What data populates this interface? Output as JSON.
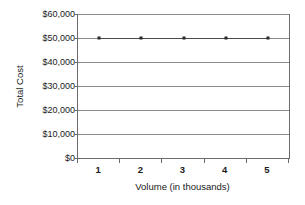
{
  "chart_data": {
    "type": "line",
    "title": "",
    "subtitle": "",
    "xlabel": "Volume (in thousands)",
    "ylabel": "Total Cost",
    "categories": [
      "1",
      "2",
      "3",
      "4",
      "5"
    ],
    "series": [
      {
        "name": "Total Cost",
        "values": [
          50000,
          50000,
          50000,
          50000,
          50000
        ],
        "line_color": "#4a4a4a",
        "marker": "square",
        "marker_color": "#262626"
      }
    ],
    "ylim": [
      0,
      60000
    ],
    "ytick_values": [
      0,
      10000,
      20000,
      30000,
      40000,
      50000,
      60000
    ],
    "ytick_labels": [
      "$0",
      "$10,000",
      "$20,000",
      "$30,000",
      "$40,000",
      "$50,000",
      "$60,000"
    ],
    "xtick_labels": [
      "1",
      "2",
      "3",
      "4",
      "5"
    ],
    "grid": {
      "horizontal": true,
      "vertical": false,
      "color": "#8c8c8c"
    },
    "legend": {
      "visible": false,
      "position": "none",
      "entries": []
    },
    "axis_border_color": "#6b6b6b",
    "background_color": "#ffffff",
    "annotations": []
  }
}
